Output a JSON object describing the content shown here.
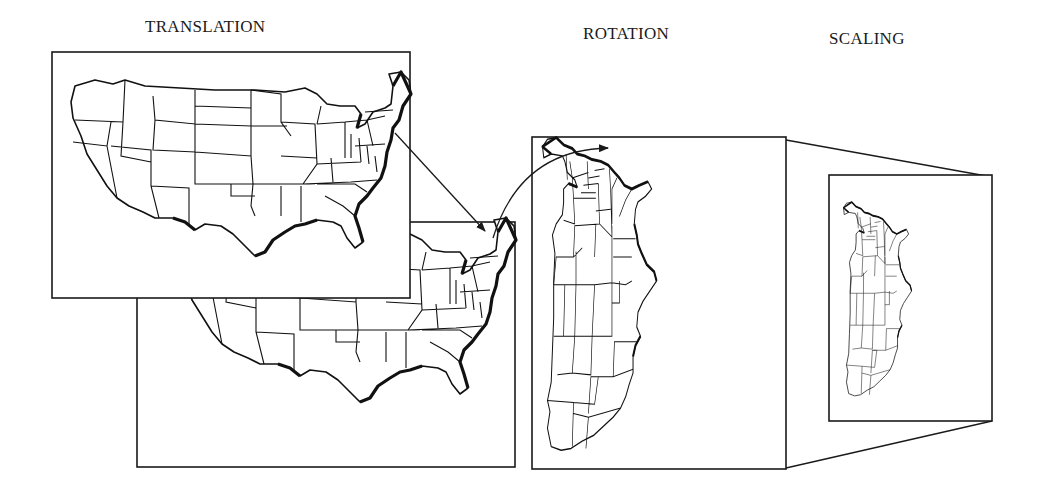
{
  "figure": {
    "panels": [
      {
        "id": "translation",
        "label": "TRANSLATION"
      },
      {
        "id": "rotation",
        "label": "ROTATION"
      },
      {
        "id": "scaling",
        "label": "SCALING"
      }
    ],
    "colors": {
      "ink": "#1a1a1a",
      "background": "#ffffff"
    }
  }
}
